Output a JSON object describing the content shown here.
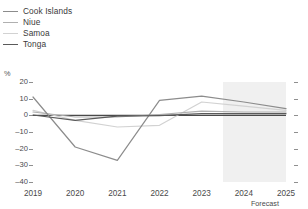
{
  "chart_data": {
    "type": "line",
    "title": "",
    "xlabel": "",
    "ylabel": "%",
    "yunit": "%",
    "x": [
      2019,
      2020,
      2021,
      2022,
      2023,
      2024,
      2025
    ],
    "categories": [
      "2019",
      "2020",
      "2021",
      "2022",
      "2023",
      "2024",
      "2025"
    ],
    "ylim": [
      -40,
      20
    ],
    "yticks": [
      20,
      10,
      0,
      -10,
      -20,
      -30,
      -40
    ],
    "ytick_labels": [
      "20",
      "10",
      "0",
      "–10",
      "–20",
      "–30",
      "–40"
    ],
    "grid": false,
    "legend_position": "top-left",
    "zero_line": 0,
    "forecast_start": 2023.5,
    "forecast_label": "Forecast",
    "forecast_years": [
      "2024",
      "2025"
    ],
    "series": [
      {
        "name": "Cook Islands",
        "color": "#8c8c8c",
        "values": [
          11.0,
          -19.0,
          -27.0,
          9.0,
          11.5,
          8.0,
          4.0
        ]
      },
      {
        "name": "Niue",
        "color": "#b0b0b0",
        "values": [
          2.0,
          -1.0,
          -1.0,
          0.5,
          2.5,
          2.0,
          2.0
        ]
      },
      {
        "name": "Samoa",
        "color": "#d2d2d2",
        "values": [
          3.0,
          -3.0,
          -7.0,
          -6.0,
          8.0,
          5.5,
          3.0
        ]
      },
      {
        "name": "Tonga",
        "color": "#5a5a5a",
        "values": [
          0.2,
          -3.0,
          -0.5,
          -0.2,
          1.0,
          1.0,
          1.0
        ]
      }
    ]
  },
  "legend": {
    "items": [
      {
        "label": "Cook Islands",
        "color": "#8c8c8c"
      },
      {
        "label": "Niue",
        "color": "#b0b0b0"
      },
      {
        "label": "Samoa",
        "color": "#d2d2d2"
      },
      {
        "label": "Tonga",
        "color": "#5a5a5a"
      }
    ]
  },
  "axes": {
    "y_unit_label": "%",
    "y_tick_labels": [
      "20",
      "10",
      "0",
      "–10",
      "–20",
      "–30",
      "–40"
    ],
    "x_tick_labels": [
      "2019",
      "2020",
      "2021",
      "2022",
      "2023",
      "2024",
      "2025"
    ],
    "forecast_caption": "Forecast"
  },
  "colors": {
    "forecast_band": "#f0f0f0",
    "zero_line": "#4a4a4a",
    "tick": "#8f8f8f",
    "text": "#4a4a4a"
  }
}
